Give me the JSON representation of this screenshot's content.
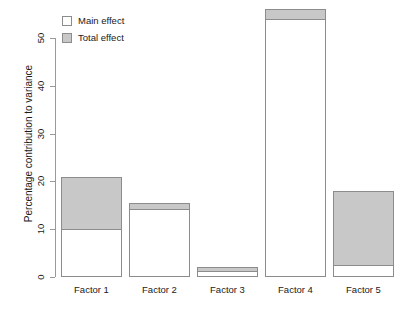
{
  "chart_data": {
    "type": "bar",
    "title": "",
    "subtitle": "",
    "xlabel": "",
    "ylabel": "Percentage contribution to variance",
    "categories": [
      "Factor 1",
      "Factor 2",
      "Factor 3",
      "Factor 4",
      "Factor 5"
    ],
    "series": [
      {
        "name": "Main effect",
        "color": "#ffffff",
        "values": [
          10.0,
          14.2,
          1.2,
          54.0,
          2.5
        ]
      },
      {
        "name": "Total effect",
        "color": "#c8c8c8",
        "values": [
          21.0,
          15.5,
          2.0,
          56.0,
          18.0
        ]
      }
    ],
    "ylim": [
      0,
      56
    ],
    "yticks": [
      0,
      10,
      20,
      30,
      40,
      50
    ],
    "ytick_labels": [
      "0",
      "10",
      "20",
      "30",
      "40",
      "50"
    ],
    "grid": false,
    "legend_position": "top-left",
    "stacking": "overlay"
  },
  "axis": {
    "y_title": "Percentage contribution to variance",
    "ticks": [
      {
        "label": "50",
        "value": 50
      },
      {
        "label": "40",
        "value": 40
      },
      {
        "label": "30",
        "value": 30
      },
      {
        "label": "20",
        "value": 20
      },
      {
        "label": "10",
        "value": 10
      },
      {
        "label": "0",
        "value": 0
      }
    ]
  },
  "legend": {
    "items": [
      {
        "label": "Main effect",
        "swatch": "white-square-icon"
      },
      {
        "label": "Total effect",
        "swatch": "gray-square-icon"
      }
    ]
  },
  "x_labels": [
    "Factor 1",
    "Factor 2",
    "Factor 3",
    "Factor 4",
    "Factor 5"
  ],
  "colors": {
    "total_effect_fill": "#c8c8c8",
    "main_effect_fill": "#ffffff",
    "bar_border": "#8c8c8c",
    "axis": "#9a9a9a",
    "text": "#1a1a1a",
    "background": "#ffffff"
  }
}
